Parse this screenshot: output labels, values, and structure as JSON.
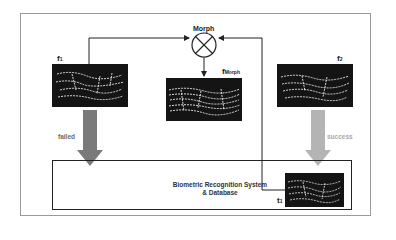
{
  "diagram": {
    "morph_node": {
      "label": "Morph",
      "icon": "circled-x"
    },
    "images": {
      "f1": {
        "label": "f",
        "subscript": "1"
      },
      "f_morph": {
        "label": "f",
        "subscript": "Morph"
      },
      "f2": {
        "label": "f",
        "subscript": "2"
      },
      "t1": {
        "label": "t",
        "subscript": "1"
      }
    },
    "arrows": {
      "failed": {
        "label": "failed",
        "color": "#7a7a7a",
        "label_color": "#6a6a6a"
      },
      "success": {
        "label": "success",
        "color": "#b4b4b4",
        "label_color": "#a8a8a8"
      }
    },
    "system_box": {
      "line1": "Biometric Recognition System",
      "line2": "& Database"
    }
  }
}
